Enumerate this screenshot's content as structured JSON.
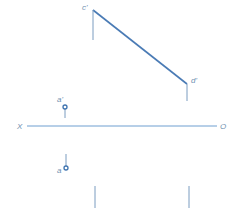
{
  "diagram": {
    "type": "orthographic-projection",
    "axis": {
      "left_label": "X",
      "right_label": "O"
    },
    "labels": {
      "c_prime": "c'",
      "d_prime": "d'",
      "a_prime": "a'",
      "a": "a"
    },
    "colors": {
      "line": "#4a7bb5",
      "axis": "#6f9fd0",
      "label": "#6e8fb0",
      "background": "#ffffff"
    }
  }
}
